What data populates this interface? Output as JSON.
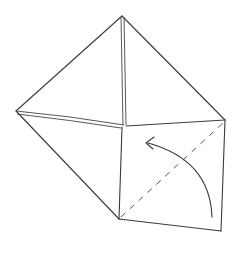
{
  "diagram": {
    "type": "origami-step",
    "stroke_color": "#3a3a3a",
    "background": "#ffffff",
    "vertices": {
      "top": [
        122,
        16
      ],
      "left": [
        16,
        111
      ],
      "center": [
        124,
        125
      ],
      "right": [
        225,
        120
      ],
      "square_bottom_left": [
        119,
        219
      ],
      "square_bottom_right": [
        221,
        231
      ]
    },
    "fold_line": {
      "style": "dashed",
      "from": [
        119,
        219
      ],
      "to": [
        223,
        122
      ]
    },
    "arrow": {
      "style": "curved",
      "from": [
        212,
        217
      ],
      "to": [
        146,
        142
      ],
      "head": "open-chevron"
    }
  }
}
